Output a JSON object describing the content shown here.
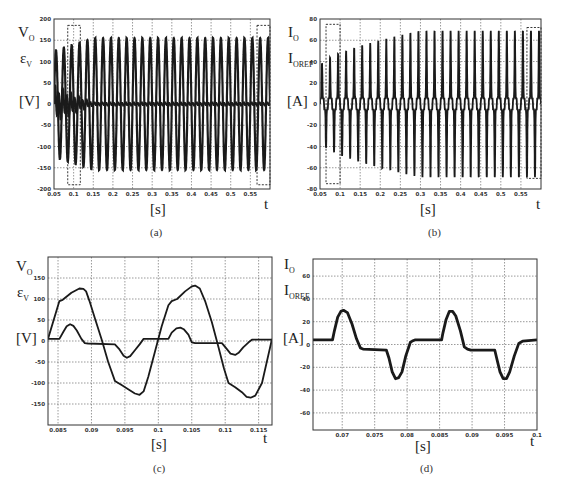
{
  "chart_data": [
    {
      "id": "a",
      "type": "line",
      "caption": "(a)",
      "ylabel_lines": [
        "V_O",
        "ε_V",
        "[V]"
      ],
      "xlabel": "[s]",
      "xvar": "t",
      "xlim": [
        0.05,
        0.6
      ],
      "ylim": [
        -200,
        200
      ],
      "xticks": [
        0.05,
        0.1,
        0.15,
        0.2,
        0.25,
        0.3,
        0.35,
        0.4,
        0.45,
        0.5,
        0.55
      ],
      "xtick_labels": [
        "0.05",
        "0.1",
        "0.15",
        "0.2",
        "0.25",
        "0.3",
        "0.35",
        "0.4",
        "0.45",
        "0.5",
        "0.55"
      ],
      "yticks": [
        -200,
        -150,
        -100,
        -50,
        0,
        50,
        100,
        150,
        200
      ],
      "ytick_labels": [
        "-200",
        "-150",
        "-100",
        "-50",
        "0",
        "50",
        "100",
        "150",
        "200"
      ],
      "grid": true,
      "series": [
        {
          "name": "V_O",
          "description": "50 Hz sinusoidal output voltage, amplitude rising from ~125 V to ~155 V by t≈0.15 s, then steady",
          "freq_hz": 50,
          "amplitude_start": 125,
          "amplitude_steady": 155,
          "settle_time": 0.15
        },
        {
          "name": "ε_V",
          "description": "voltage error, initial amplitude ~40 V decaying to ~0 by t≈0.15 s",
          "amplitude_start": 40,
          "amplitude_end": 3,
          "settle_time": 0.15
        }
      ],
      "annotations": [
        {
          "type": "dashed-box",
          "x": [
            0.085,
            0.117
          ],
          "y": [
            -190,
            185
          ]
        },
        {
          "type": "dashed-box",
          "x": [
            0.567,
            0.6
          ],
          "y": [
            -190,
            185
          ]
        }
      ]
    },
    {
      "id": "b",
      "type": "line",
      "caption": "(b)",
      "ylabel_lines": [
        "I_O",
        "I_OREF",
        "[A]"
      ],
      "xlabel": "[s]",
      "xvar": "t",
      "xlim": [
        0.05,
        0.6
      ],
      "ylim": [
        -80,
        80
      ],
      "xticks": [
        0.05,
        0.1,
        0.15,
        0.2,
        0.25,
        0.3,
        0.35,
        0.4,
        0.45,
        0.5,
        0.55
      ],
      "xtick_labels": [
        "0.05",
        "0.1",
        "0.15",
        "0.2",
        "0.25",
        "0.3",
        "0.35",
        "0.4",
        "0.45",
        "0.5",
        "0.55"
      ],
      "yticks": [
        -80,
        -60,
        -40,
        -20,
        0,
        20,
        40,
        60,
        80
      ],
      "ytick_labels": [
        "-80",
        "-60",
        "-40",
        "-20",
        "0",
        "20",
        "40",
        "60",
        "80"
      ],
      "grid": true,
      "series": [
        {
          "name": "I_O",
          "description": "pulsed current, peaks rising from ~30 A to ~64 A by t≈0.3 s, then steady",
          "freq_hz": 50,
          "amplitude_start": 30,
          "amplitude_steady": 64,
          "settle_time": 0.3
        },
        {
          "name": "I_OREF",
          "description": "reference current tracking I_O"
        }
      ],
      "annotations": [
        {
          "type": "dashed-box",
          "x": [
            0.065,
            0.1
          ],
          "y": [
            -75,
            75
          ]
        },
        {
          "type": "dashed-box",
          "x": [
            0.565,
            0.6
          ],
          "y": [
            -70,
            72
          ]
        }
      ]
    },
    {
      "id": "c",
      "type": "line",
      "caption": "(c)",
      "ylabel_lines": [
        "V_O",
        "ε_V",
        "[V]"
      ],
      "xlabel": "[s]",
      "xvar": "t",
      "xlim": [
        0.0835,
        0.117
      ],
      "ylim": [
        -200,
        200
      ],
      "xticks": [
        0.085,
        0.09,
        0.095,
        0.1,
        0.105,
        0.11,
        0.115
      ],
      "xtick_labels": [
        "0.085",
        "0.09",
        "0.095",
        "0.1",
        "0.105",
        "0.11",
        "0.115"
      ],
      "yticks": [
        -150,
        -100,
        -50,
        0,
        50,
        100,
        150
      ],
      "ytick_labels": [
        "-150",
        "-100",
        "-50",
        "0",
        "50",
        "100",
        "150"
      ],
      "grid": true,
      "series": [
        {
          "name": "V_O",
          "x": [
            0.0835,
            0.0852,
            0.0857,
            0.087,
            0.0882,
            0.0888,
            0.0892,
            0.0897,
            0.0905,
            0.0915,
            0.0925,
            0.0935,
            0.0945,
            0.0955,
            0.0965,
            0.0972,
            0.0978,
            0.0985,
            0.0995,
            0.1005,
            0.1015,
            0.102,
            0.1028,
            0.104,
            0.105,
            0.1055,
            0.1062,
            0.107,
            0.108,
            0.109,
            0.1098,
            0.1105,
            0.1115,
            0.1125,
            0.1132,
            0.1138,
            0.1145,
            0.1155,
            0.117
          ],
          "y": [
            5,
            95,
            98,
            115,
            125,
            124,
            118,
            95,
            55,
            5,
            -50,
            -95,
            -105,
            -115,
            -125,
            -128,
            -120,
            -85,
            -25,
            35,
            85,
            95,
            100,
            118,
            130,
            132,
            125,
            95,
            45,
            -15,
            -65,
            -100,
            -110,
            -122,
            -133,
            -135,
            -130,
            -100,
            5
          ]
        },
        {
          "name": "ε_V",
          "x": [
            0.0835,
            0.0852,
            0.0858,
            0.0863,
            0.0868,
            0.0873,
            0.0878,
            0.0885,
            0.089,
            0.0895,
            0.0935,
            0.0942,
            0.0948,
            0.0953,
            0.0958,
            0.0965,
            0.0972,
            0.0978,
            0.1015,
            0.102,
            0.1027,
            0.1033,
            0.1038,
            0.1045,
            0.105,
            0.1055,
            0.1095,
            0.1102,
            0.1108,
            0.1115,
            0.112,
            0.1127,
            0.1135,
            0.114,
            0.117
          ],
          "y": [
            5,
            5,
            22,
            35,
            40,
            36,
            25,
            5,
            -5,
            -6,
            -8,
            -20,
            -35,
            -40,
            -36,
            -22,
            -8,
            5,
            5,
            20,
            30,
            32,
            28,
            15,
            -3,
            -5,
            -5,
            -18,
            -30,
            -33,
            -28,
            -15,
            -3,
            3,
            3
          ]
        }
      ]
    },
    {
      "id": "d",
      "type": "line",
      "caption": "(d)",
      "ylabel_lines": [
        "I_O",
        "I_OREF",
        "[A]"
      ],
      "xlabel": "[s]",
      "xvar": "t",
      "xlim": [
        0.0655,
        0.1
      ],
      "ylim": [
        -75,
        75
      ],
      "xticks": [
        0.07,
        0.075,
        0.08,
        0.085,
        0.09,
        0.095,
        0.1
      ],
      "xtick_labels": [
        "0.07",
        "0.075",
        "0.08",
        "0.085",
        "0.09",
        "0.095",
        "0.1"
      ],
      "yticks": [
        -60,
        -40,
        -20,
        0,
        20,
        40,
        60
      ],
      "ytick_labels": [
        "-60",
        "-40",
        "-20",
        "0",
        "20",
        "40",
        "60"
      ],
      "grid": true,
      "series": [
        {
          "name": "I_O / I_OREF",
          "x": [
            0.0655,
            0.0685,
            0.0688,
            0.0693,
            0.0698,
            0.0702,
            0.0708,
            0.0715,
            0.0722,
            0.0728,
            0.0732,
            0.0768,
            0.0772,
            0.0777,
            0.0782,
            0.0787,
            0.0792,
            0.0798,
            0.0805,
            0.0808,
            0.0812,
            0.0853,
            0.0855,
            0.086,
            0.0865,
            0.087,
            0.0875,
            0.0882,
            0.0888,
            0.0893,
            0.0898,
            0.0935,
            0.0938,
            0.0943,
            0.0948,
            0.0953,
            0.0958,
            0.0965,
            0.0972,
            0.0975,
            0.0978,
            0.1
          ],
          "y": [
            4,
            4,
            12,
            24,
            29,
            30,
            28,
            18,
            5,
            -3,
            -4,
            -5,
            -12,
            -24,
            -30,
            -29,
            -24,
            -10,
            2,
            3,
            4,
            4,
            10,
            22,
            29,
            29,
            25,
            12,
            -2,
            -4,
            -5,
            -5,
            -12,
            -24,
            -30,
            -30,
            -24,
            -10,
            1,
            2,
            3,
            4
          ]
        }
      ]
    }
  ],
  "panels": {
    "a": {
      "caption": "(a)",
      "y1": "V",
      "y1sub": "O",
      "y2": "ε",
      "y2sub": "V",
      "unit": "[V]",
      "xunit": "[s]",
      "xvar": "t"
    },
    "b": {
      "caption": "(b)",
      "y1": "I",
      "y1sub": "O",
      "y2": "I",
      "y2sub": "OREF",
      "unit": "[A]",
      "xunit": "[s]",
      "xvar": "t"
    },
    "c": {
      "caption": "(c)",
      "y1": "V",
      "y1sub": "O",
      "y2": "ε",
      "y2sub": "V",
      "unit": "[V]",
      "xunit": "[s]",
      "xvar": "t"
    },
    "d": {
      "caption": "(d)",
      "y1": "I",
      "y1sub": "O",
      "y2": "I",
      "y2sub": "OREF",
      "unit": "[A]",
      "xunit": "[s]",
      "xvar": "t"
    }
  },
  "colors": {
    "trace": "#1a1a1a",
    "grid": "#555555",
    "frame": "#333333",
    "tick_text": "#333333"
  }
}
